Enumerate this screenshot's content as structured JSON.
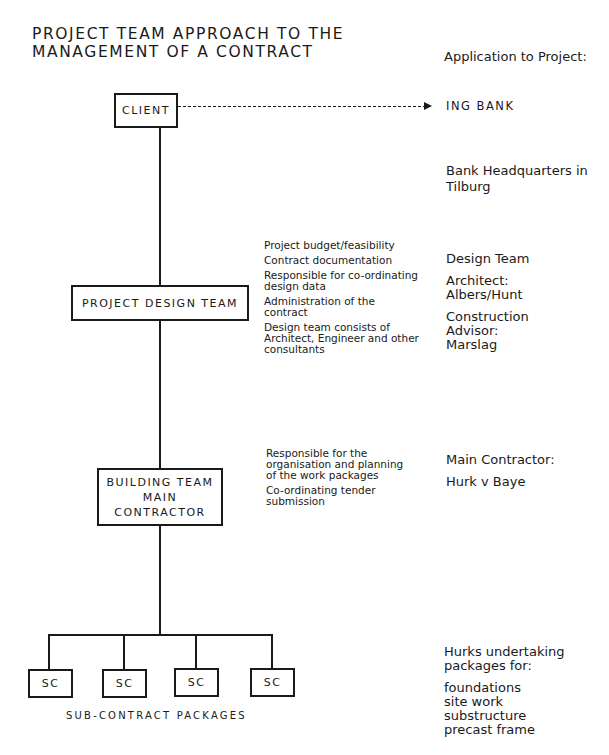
{
  "title": {
    "line1": "PROJECT TEAM APPROACH TO THE",
    "line2": "MANAGEMENT OF A CONTRACT"
  },
  "boxes": {
    "client": "CLIENT",
    "design_team": "PROJECT DESIGN TEAM",
    "building_team": [
      "BUILDING TEAM",
      "MAIN",
      "CONTRACTOR"
    ],
    "subcontracts": [
      "SC",
      "SC",
      "SC",
      "SC"
    ]
  },
  "caption": "SUB-CONTRACT PACKAGES",
  "design_notes": [
    "Project budget/feasibility",
    "Contract documentation",
    "Responsible for co-ordinating design data",
    "Administration of the contract",
    "Design team consists of Architect, Engineer and other consultants"
  ],
  "building_notes": [
    "Responsible for the organisation and planning of the work packages",
    "Co-ordinating tender submission"
  ],
  "application": {
    "heading": "Application to Project:",
    "client": "ING BANK",
    "project": "Bank Headquarters in Tilburg",
    "design_team_label": "Design Team",
    "architect_label": "Architect:",
    "architect": "Albers/Hunt",
    "advisor_label": "Construction Advisor:",
    "advisor": "Marslag",
    "contractor_label": "Main Contractor:",
    "contractor": "Hurk v Baye",
    "packages_label": "Hurks undertaking packages for:",
    "packages": [
      "foundations",
      "site work",
      "substructure",
      "precast frame"
    ]
  }
}
